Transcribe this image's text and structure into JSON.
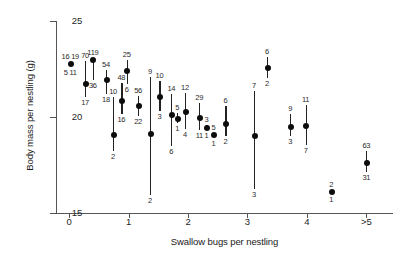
{
  "chart_data": {
    "type": "scatter",
    "title": "",
    "xlabel": "Swallow bugs per nestling",
    "ylabel": "Body mass per nestling (g)",
    "xlim": [
      -0.22,
      5.45
    ],
    "ylim": [
      14.4,
      25.4
    ],
    "grid": false,
    "legend": null,
    "ytick_labels": [
      "25",
      "20",
      "15"
    ],
    "ytick_values": [
      25,
      20,
      15
    ],
    "xtick_labels": [
      "0",
      "1",
      "2",
      "3",
      "4",
      ">5"
    ],
    "xtick_values": [
      0,
      1,
      2,
      3,
      4,
      5
    ],
    "marker": "filled-circle-with-vertical-range-bar",
    "note": "Each datum is a mean body mass with a vertical range bar; small numbers above and below give the upper and lower sample sizes.",
    "points": [
      {
        "x": 0.02,
        "y": 22.75,
        "low": 22.62,
        "high": 22.88,
        "label_top": "16 19",
        "label_bottom": "5 11"
      },
      {
        "x": 0.27,
        "y": 21.7,
        "low": 21.05,
        "high": 22.9,
        "label_top": "70",
        "label_bottom": "17"
      },
      {
        "x": 0.4,
        "y": 22.95,
        "low": 21.95,
        "high": 23.05,
        "label_top": "119",
        "label_bottom": "36"
      },
      {
        "x": 0.62,
        "y": 21.95,
        "low": 21.2,
        "high": 22.45,
        "label_top": "54",
        "label_bottom": "18"
      },
      {
        "x": 0.74,
        "y": 19.05,
        "low": 18.25,
        "high": 21.05,
        "label_top": "10",
        "label_bottom": "2"
      },
      {
        "x": 0.88,
        "y": 20.85,
        "low": 20.15,
        "high": 21.75,
        "label_top": "48",
        "label_bottom": "16"
      },
      {
        "x": 0.97,
        "y": 22.4,
        "low": 21.7,
        "high": 22.95,
        "label_top": "25",
        "label_bottom": "6"
      },
      {
        "x": 1.16,
        "y": 20.55,
        "low": 20.05,
        "high": 21.1,
        "label_top": "56",
        "label_bottom": "22"
      },
      {
        "x": 1.36,
        "y": 19.1,
        "low": 15.95,
        "high": 22.1,
        "label_top": "9",
        "label_bottom": "2"
      },
      {
        "x": 1.52,
        "y": 21.05,
        "low": 20.3,
        "high": 21.9,
        "label_top": "10",
        "label_bottom": "3"
      },
      {
        "x": 1.72,
        "y": 20.1,
        "low": 18.5,
        "high": 21.2,
        "label_top": "14",
        "label_bottom": "6"
      },
      {
        "x": 1.82,
        "y": 19.9,
        "low": 19.7,
        "high": 20.2,
        "label_top": "5",
        "label_bottom": "1"
      },
      {
        "x": 1.95,
        "y": 20.25,
        "low": 19.4,
        "high": 21.25,
        "label_top": "12",
        "label_bottom": "4"
      },
      {
        "x": 2.19,
        "y": 19.95,
        "low": 19.3,
        "high": 20.75,
        "label_top": "29",
        "label_bottom": "11"
      },
      {
        "x": 2.31,
        "y": 19.45,
        "low": 19.33,
        "high": 19.58,
        "label_top": "3",
        "label_bottom": "1"
      },
      {
        "x": 2.43,
        "y": 19.05,
        "low": 18.93,
        "high": 19.18,
        "label_top": "5",
        "label_bottom": "1"
      },
      {
        "x": 2.63,
        "y": 19.65,
        "low": 19.0,
        "high": 20.55,
        "label_top": "6",
        "label_bottom": "2"
      },
      {
        "x": 3.11,
        "y": 19.0,
        "low": 16.25,
        "high": 21.35,
        "label_top": "7",
        "label_bottom": "3"
      },
      {
        "x": 3.33,
        "y": 22.55,
        "low": 22.05,
        "high": 23.15,
        "label_top": "6",
        "label_bottom": "2"
      },
      {
        "x": 3.72,
        "y": 19.5,
        "low": 19.0,
        "high": 20.15,
        "label_top": "9",
        "label_bottom": "3"
      },
      {
        "x": 3.98,
        "y": 19.55,
        "low": 18.55,
        "high": 20.65,
        "label_top": "11",
        "label_bottom": "7"
      },
      {
        "x": 4.41,
        "y": 16.1,
        "low": 15.98,
        "high": 16.22,
        "label_top": "2",
        "label_bottom": "1"
      },
      {
        "x": 5.0,
        "y": 17.6,
        "low": 17.15,
        "high": 18.25,
        "label_top": "63",
        "label_bottom": "31"
      }
    ]
  },
  "colors": {
    "marker": "#0d0d0d",
    "axis": "#555555",
    "text": "#1a1a1a"
  }
}
